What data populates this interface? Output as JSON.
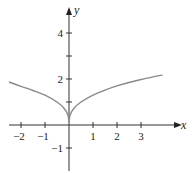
{
  "chart_data": {
    "type": "line",
    "title": "",
    "xlabel": "x",
    "ylabel": "y",
    "xlim": [
      -2.5,
      4.5
    ],
    "ylim": [
      -2,
      5.5
    ],
    "grid": false,
    "legend": null,
    "x_ticks": [
      -2,
      -1,
      1,
      2,
      3
    ],
    "x_tick_labels": [
      "−2",
      "−1",
      "1",
      "2",
      "3"
    ],
    "y_ticks": [
      -1,
      1,
      2,
      3,
      4
    ],
    "y_tick_labels": [
      "−1",
      "2",
      "4"
    ],
    "y_labeled_ticks": [
      -1,
      2,
      4
    ],
    "series": [
      {
        "name": "curve",
        "color": "#8a8a8a",
        "x": [
          -2.5,
          -2,
          -1.5,
          -1,
          -0.5,
          -0.2,
          -0.05,
          0,
          0.05,
          0.2,
          0.5,
          1,
          1.5,
          2,
          2.5,
          3,
          3.5,
          3.9
        ],
        "y": [
          1.87,
          1.68,
          1.5,
          1.3,
          1.0,
          0.72,
          0.45,
          0.15,
          0.45,
          0.72,
          1.0,
          1.3,
          1.52,
          1.7,
          1.85,
          1.98,
          2.09,
          2.17
        ]
      }
    ]
  }
}
